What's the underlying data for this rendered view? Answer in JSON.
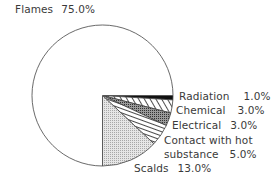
{
  "chart_data": {
    "type": "pie",
    "title": "",
    "categories": [
      "Flames",
      "Scalds",
      "Contact with hot substance",
      "Electrical",
      "Chemical",
      "Radiation"
    ],
    "values": [
      75.0,
      13.0,
      5.0,
      3.0,
      3.0,
      1.0
    ],
    "unit": "%",
    "slices": [
      {
        "label": "Radiation",
        "value": 1.0,
        "display": "1.0%",
        "pattern": "solid-black"
      },
      {
        "label": "Chemical",
        "value": 3.0,
        "display": "3.0%",
        "pattern": "diagonal-hatch"
      },
      {
        "label": "Electrical",
        "value": 3.0,
        "display": "3.0%",
        "pattern": "dense-dots"
      },
      {
        "label": "Contact with hot substance",
        "value": 5.0,
        "display": "5.0%",
        "pattern": "horizontal-lines"
      },
      {
        "label": "Scalds",
        "value": 13.0,
        "display": "13.0%",
        "pattern": "light-dots"
      },
      {
        "label": "Flames",
        "value": 75.0,
        "display": "75.0%",
        "pattern": "white"
      }
    ],
    "start_angle": "3 o'clock, clockwise for small slices",
    "legend": "none (direct labels)"
  },
  "labels": {
    "flames": {
      "name": "Flames",
      "pct": "75.0%"
    },
    "radiation": {
      "name": "Radiation",
      "pct": "1.0%"
    },
    "chemical": {
      "name": "Chemical",
      "pct": "3.0%"
    },
    "electrical": {
      "name": "Electrical",
      "pct": "3.0%"
    },
    "contact_line1": "Contact with hot",
    "contact_line2": {
      "name": "substance",
      "pct": "5.0%"
    },
    "scalds": {
      "name": "Scalds",
      "pct": "13.0%"
    }
  }
}
